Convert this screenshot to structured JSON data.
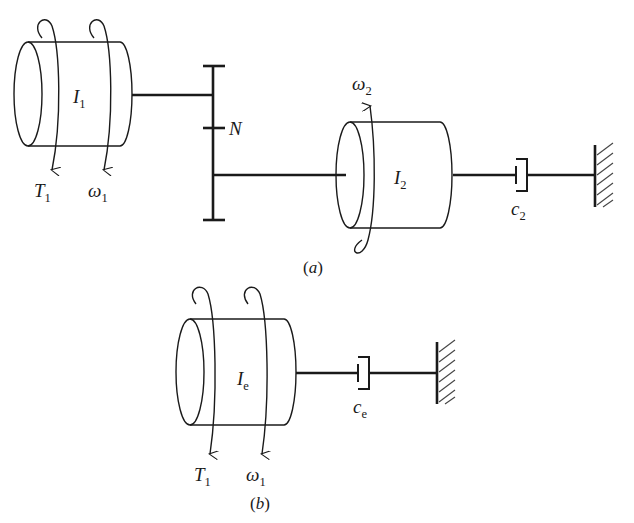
{
  "figure": {
    "part_a": {
      "caption_open": "(",
      "caption_letter": "a",
      "caption_close": ")",
      "inertia_1": {
        "symbol": "I",
        "subscript": "1"
      },
      "torque_1": {
        "symbol": "T",
        "subscript": "1"
      },
      "omega_1": {
        "symbol": "ω",
        "subscript": "1"
      },
      "gear_ratio": {
        "symbol": "N"
      },
      "omega_2": {
        "symbol": "ω",
        "subscript": "2"
      },
      "inertia_2": {
        "symbol": "I",
        "subscript": "2"
      },
      "damper_2": {
        "symbol": "c",
        "subscript": "2"
      }
    },
    "part_b": {
      "caption_open": "(",
      "caption_letter": "b",
      "caption_close": ")",
      "inertia_e": {
        "symbol": "I",
        "subscript": "e"
      },
      "torque_1": {
        "symbol": "T",
        "subscript": "1"
      },
      "omega_1": {
        "symbol": "ω",
        "subscript": "1"
      },
      "damper_e": {
        "symbol": "c",
        "subscript": "e"
      }
    },
    "colors": {
      "stroke": "#1a1a1a",
      "background": "#ffffff"
    }
  }
}
